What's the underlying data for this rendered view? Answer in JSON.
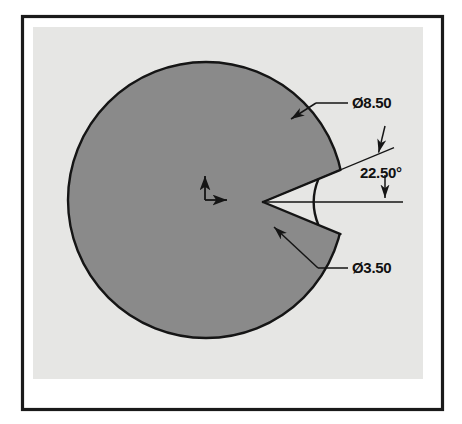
{
  "drawing": {
    "title": "Sector cut circular part drawing",
    "canvas": {
      "width": 462,
      "height": 424
    },
    "frame": {
      "border_color": "#1a1a1a",
      "paper_color": "#ffffff",
      "sheet_color": "#e8e8e6",
      "x": 21,
      "y": 15,
      "width": 422,
      "height": 395
    },
    "part": {
      "fill_color": "#8a8a8a",
      "outline_color": "#151515",
      "center_x": 206,
      "center_y": 200,
      "radius": 138
    },
    "notch": {
      "apex_x": 263,
      "apex_y": 202,
      "half_angle_deg": 22.5,
      "inner_arc_radius": 60,
      "outer_arc_radius": 138
    },
    "datum": {
      "name": "origin-datum-marker",
      "x": 205,
      "y": 200,
      "arrow_length": 28
    },
    "dimensions": [
      {
        "id": "outer-diameter",
        "label": "Ø8.50",
        "value": 8.5,
        "symbol": "Ø",
        "kind": "diameter",
        "text_x": 352,
        "text_y": 107
      },
      {
        "id": "included-angle",
        "label": "22.50°",
        "value": 22.5,
        "symbol": "°",
        "kind": "angle",
        "text_x": 360,
        "text_y": 178
      },
      {
        "id": "inner-diameter",
        "label": "Ø3.50",
        "value": 3.5,
        "symbol": "Ø",
        "kind": "diameter",
        "text_x": 352,
        "text_y": 272
      }
    ],
    "colors": {
      "line": "#151515",
      "part_fill": "#8a8a8a",
      "sheet": "#e8e8e6",
      "paper": "#ffffff",
      "text": "#111111"
    }
  }
}
